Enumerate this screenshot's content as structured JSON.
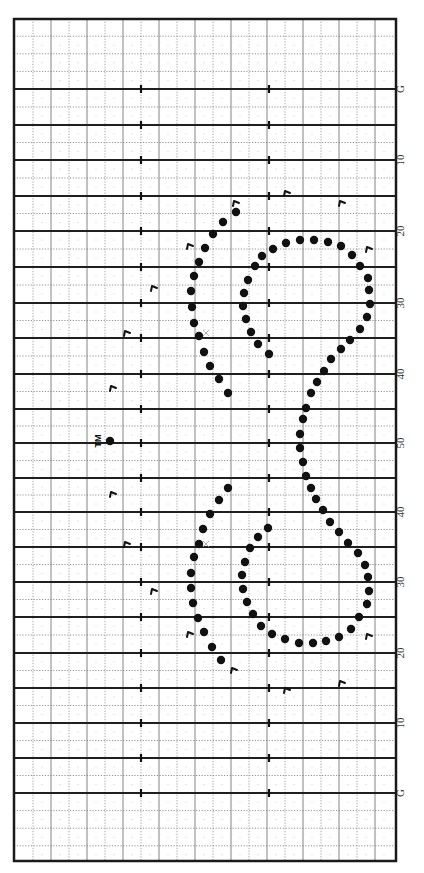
{
  "field": {
    "left": 14,
    "right": 396,
    "top": 19,
    "bottom": 861,
    "border_color": "#1a1a1a",
    "grid_color": "#888888",
    "yard_line_color": "#1f1f1f",
    "minor_cols_x": [
      33,
      51,
      69,
      87,
      105,
      123,
      141,
      159,
      177,
      195,
      213,
      231,
      249,
      267,
      285,
      303,
      321,
      339,
      357,
      375
    ],
    "hash_x": [
      141,
      269
    ],
    "yard_lines": [
      {
        "y": 89,
        "label": "G"
      },
      {
        "y": 125,
        "label": ""
      },
      {
        "y": 160,
        "label": "10"
      },
      {
        "y": 196,
        "label": ""
      },
      {
        "y": 231,
        "label": "20"
      },
      {
        "y": 267,
        "label": ""
      },
      {
        "y": 303,
        "label": "30"
      },
      {
        "y": 338,
        "label": ""
      },
      {
        "y": 374,
        "label": "40"
      },
      {
        "y": 409,
        "label": ""
      },
      {
        "y": 443,
        "label": "50"
      },
      {
        "y": 478,
        "label": ""
      },
      {
        "y": 512,
        "label": "40"
      },
      {
        "y": 547,
        "label": ""
      },
      {
        "y": 582,
        "label": "30"
      },
      {
        "y": 617,
        "label": ""
      },
      {
        "y": 653,
        "label": "20"
      },
      {
        "y": 688,
        "label": ""
      },
      {
        "y": 723,
        "label": "10"
      },
      {
        "y": 758,
        "label": ""
      },
      {
        "y": 793,
        "label": "G"
      }
    ],
    "label_x": 404
  },
  "drum_major": {
    "label": "TM",
    "x": 110,
    "y": 441
  },
  "performers": [
    [
      236,
      212
    ],
    [
      223,
      222
    ],
    [
      213,
      234
    ],
    [
      205,
      248
    ],
    [
      199,
      262
    ],
    [
      194,
      276
    ],
    [
      191,
      291
    ],
    [
      192,
      307
    ],
    [
      194,
      323
    ],
    [
      199,
      336
    ],
    [
      204,
      352
    ],
    [
      210,
      366
    ],
    [
      219,
      379
    ],
    [
      228,
      393
    ],
    [
      273,
      249
    ],
    [
      262,
      256
    ],
    [
      255,
      266
    ],
    [
      248,
      280
    ],
    [
      244,
      293
    ],
    [
      243,
      306
    ],
    [
      246,
      319
    ],
    [
      251,
      332
    ],
    [
      258,
      344
    ],
    [
      269,
      354
    ],
    [
      286,
      243
    ],
    [
      300,
      240
    ],
    [
      314,
      240
    ],
    [
      328,
      242
    ],
    [
      341,
      246
    ],
    [
      352,
      255
    ],
    [
      360,
      266
    ],
    [
      368,
      278
    ],
    [
      369,
      290
    ],
    [
      370,
      304
    ],
    [
      367,
      317
    ],
    [
      360,
      329
    ],
    [
      350,
      340
    ],
    [
      341,
      349
    ],
    [
      331,
      359
    ],
    [
      324,
      371
    ],
    [
      317,
      382
    ],
    [
      311,
      393
    ],
    [
      306,
      408
    ],
    [
      303,
      419
    ],
    [
      300,
      434
    ],
    [
      300,
      448
    ],
    [
      303,
      462
    ],
    [
      306,
      476
    ],
    [
      311,
      488
    ],
    [
      316,
      499
    ],
    [
      323,
      510
    ],
    [
      330,
      522
    ],
    [
      339,
      532
    ],
    [
      348,
      543
    ],
    [
      358,
      553
    ],
    [
      228,
      488
    ],
    [
      219,
      500
    ],
    [
      210,
      514
    ],
    [
      203,
      529
    ],
    [
      199,
      544
    ],
    [
      194,
      557
    ],
    [
      191,
      573
    ],
    [
      191,
      588
    ],
    [
      193,
      603
    ],
    [
      198,
      618
    ],
    [
      204,
      632
    ],
    [
      212,
      647
    ],
    [
      221,
      660
    ],
    [
      268,
      528
    ],
    [
      258,
      537
    ],
    [
      250,
      548
    ],
    [
      245,
      562
    ],
    [
      242,
      575
    ],
    [
      243,
      589
    ],
    [
      247,
      602
    ],
    [
      253,
      614
    ],
    [
      261,
      626
    ],
    [
      272,
      634
    ],
    [
      285,
      639
    ],
    [
      299,
      643
    ],
    [
      313,
      643
    ],
    [
      326,
      641
    ],
    [
      339,
      637
    ],
    [
      351,
      629
    ],
    [
      359,
      617
    ],
    [
      367,
      604
    ],
    [
      369,
      591
    ],
    [
      368,
      577
    ],
    [
      365,
      565
    ]
  ],
  "facing_markers": [
    [
      287,
      193
    ],
    [
      342,
      203
    ],
    [
      236,
      203
    ],
    [
      190,
      246
    ],
    [
      369,
      249
    ],
    [
      154,
      288
    ],
    [
      127,
      333
    ],
    [
      113,
      388
    ],
    [
      113,
      494
    ],
    [
      127,
      544
    ],
    [
      154,
      591
    ],
    [
      190,
      634
    ],
    [
      369,
      636
    ],
    [
      234,
      670
    ],
    [
      287,
      690
    ],
    [
      342,
      683
    ]
  ],
  "x_marks": [
    [
      206,
      333
    ],
    [
      206,
      544
    ]
  ]
}
